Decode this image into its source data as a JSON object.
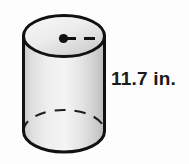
{
  "figure": {
    "type": "cylinder-diagram",
    "shape_name": "cylinder",
    "height_label": "11.7 in.",
    "height_value": 11.7,
    "height_unit": "in.",
    "colors": {
      "background": "#fdfdfd",
      "outline": "#111111",
      "body_fill_light": "#f2f2f2",
      "body_fill_mid": "#dcdcdc",
      "body_fill_dark": "#bdbdbd",
      "top_fill_light": "#f4f4f4",
      "top_fill_dark": "#c9c9c9",
      "hidden_edge": "#1a1a1a"
    },
    "parts": [
      {
        "name": "top-ellipse",
        "style": "solid",
        "description": "visible top face of cylinder"
      },
      {
        "name": "body",
        "style": "shaded",
        "description": "lateral surface with gradient shading"
      },
      {
        "name": "bottom-front-arc",
        "style": "solid",
        "description": "visible front edge of base"
      },
      {
        "name": "bottom-back-arc",
        "style": "dashed",
        "description": "hidden back edge of base"
      },
      {
        "name": "center-dot",
        "style": "filled",
        "description": "center point of top face"
      },
      {
        "name": "radius-line",
        "style": "dashed",
        "description": "radius segment from center to rim"
      }
    ]
  }
}
